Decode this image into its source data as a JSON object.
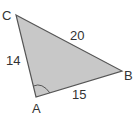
{
  "diagram": {
    "type": "triangle",
    "fill_color": "#c8c8c8",
    "stroke_color": "#555555",
    "vertices": [
      {
        "name": "A",
        "x": 36,
        "y": 97
      },
      {
        "name": "B",
        "x": 122,
        "y": 71
      },
      {
        "name": "C",
        "x": 16,
        "y": 15
      }
    ],
    "labels": {
      "A": "A",
      "B": "B",
      "C": "C"
    },
    "sides": {
      "CB": "20",
      "CA": "14",
      "AB": "15"
    },
    "angle_marker": "A"
  }
}
